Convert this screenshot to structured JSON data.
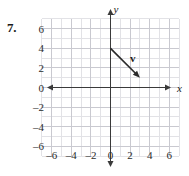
{
  "problem": {
    "number": "7."
  },
  "chart_data": {
    "type": "scatter",
    "title": "",
    "xlabel": "x",
    "ylabel": "y",
    "xlim": [
      -7,
      7
    ],
    "ylim": [
      -7,
      7
    ],
    "grid": true,
    "legend": false,
    "x_tick_labels": [
      "-6",
      "-4",
      "-2",
      "0",
      "2",
      "4",
      "6"
    ],
    "x_tick_values": [
      -6,
      -4,
      -2,
      0,
      2,
      4,
      6
    ],
    "y_tick_labels": [
      "6",
      "4",
      "2",
      "0",
      "-2",
      "-4",
      "-6"
    ],
    "y_tick_values": [
      6,
      4,
      2,
      0,
      -2,
      -4,
      -6
    ],
    "minor_grid_step": 1,
    "major_grid_step": 2,
    "vectors": [
      {
        "name": "v",
        "tail": [
          0,
          4
        ],
        "head": [
          3,
          1
        ],
        "components": [
          3,
          -3
        ],
        "label_position": [
          2.0,
          2.6
        ]
      }
    ],
    "colors": {
      "axis": "#3a3a3a",
      "minor_grid": "#e2e2e6",
      "major_grid": "#c9c9d0",
      "vector": "#2a2a2a",
      "text": "#1a1a1a"
    }
  }
}
